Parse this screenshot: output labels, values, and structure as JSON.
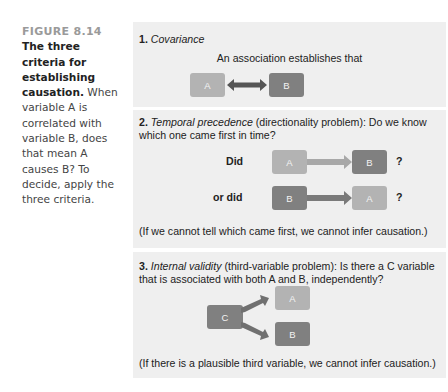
{
  "caption": {
    "figure_label": "FIGURE 8.14",
    "title": "The three criteria for establishing causation.",
    "body": " When variable A is correlated with variable B, does that mean A causes B? To decide, apply the three criteria."
  },
  "sections": [
    {
      "number": "1.",
      "term": "Covariance",
      "description": "",
      "statement": "An association establishes that",
      "diagram": {
        "left": "A",
        "right": "B",
        "arrow": "bidirectional"
      }
    },
    {
      "number": "2.",
      "term": "Temporal precedence",
      "description": " (directionality problem): Do we know which one came first in time?",
      "rows": [
        {
          "label": "Did",
          "from": "A",
          "to": "B",
          "mark": "?"
        },
        {
          "label": "or did",
          "from": "B",
          "to": "A",
          "mark": "?"
        }
      ],
      "note": "(If we cannot tell which came first, we cannot infer causation.)"
    },
    {
      "number": "3.",
      "term": "Internal validity",
      "description": " (third-variable problem): Is there a C variable that is associated with both A and B, independently?",
      "diagram": {
        "source": "C",
        "targets": [
          "A",
          "B"
        ]
      },
      "note": "(If there is a plausible third variable, we cannot infer causation.)"
    }
  ],
  "colors": {
    "panel_bg": "#efefef",
    "box_light": "#b3b3b3",
    "box_dark": "#808080",
    "arrow": "#555555",
    "arrow_light": "#a8a8a8",
    "figure_label": "#9a9a9a"
  }
}
